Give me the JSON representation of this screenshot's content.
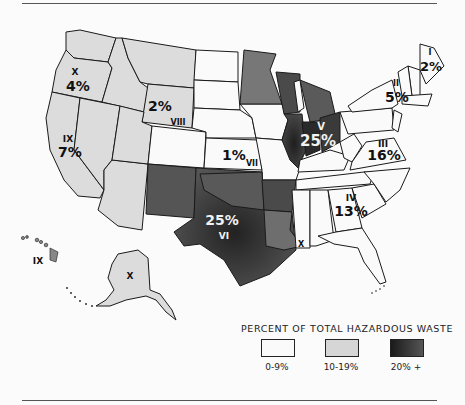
{
  "map": {
    "subject": "United States by EPA region",
    "regions": [
      {
        "id": "I",
        "numeral": "I",
        "percent": "2%",
        "bin": "0-9%"
      },
      {
        "id": "II",
        "numeral": "II",
        "percent": "5%",
        "bin": "0-9%"
      },
      {
        "id": "III",
        "numeral": "III",
        "percent": "16%",
        "bin": "10-19%"
      },
      {
        "id": "IV",
        "numeral": "IV",
        "percent": "13%",
        "bin": "10-19%"
      },
      {
        "id": "V",
        "numeral": "V",
        "percent": "25%",
        "bin": "20% +"
      },
      {
        "id": "VI",
        "numeral": "VI",
        "percent": "25%",
        "bin": "20% +"
      },
      {
        "id": "VII",
        "numeral": "VII",
        "percent": "1%",
        "bin": "0-9%"
      },
      {
        "id": "VIII",
        "numeral": "VIII",
        "percent": "2%",
        "bin": "0-9%"
      },
      {
        "id": "IX",
        "numeral": "IX",
        "percent": "7%",
        "bin": "0-9%"
      },
      {
        "id": "X",
        "numeral": "X",
        "percent": "4%",
        "bin": "0-9%"
      }
    ],
    "insets": {
      "hawaii_label": "IX",
      "alaska_label": "X"
    }
  },
  "legend": {
    "title": "PERCENT OF TOTAL HAZARDOUS WASTE",
    "items": [
      {
        "label": "0-9%",
        "color": "#fafafa"
      },
      {
        "label": "10-19%",
        "color": "#d6d6d6"
      },
      {
        "label": "20% +",
        "color": "#2a2a2a"
      }
    ]
  },
  "colors": {
    "low": "#f7f7f7",
    "mid": "#d9d9d9",
    "high": "#3a3a3a",
    "stroke": "#1a1a1a"
  }
}
